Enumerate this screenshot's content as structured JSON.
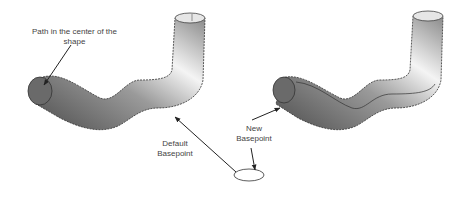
{
  "figure": {
    "left_shape": {
      "annotation": "Path in the center of the shape"
    },
    "right_shape": {},
    "labels": {
      "default_basepoint": "Default Basepoint",
      "new_basepoint": "New Basepoint",
      "path_center_line1": "Path in the center of the",
      "path_center_line2": "shape",
      "default_line1": "Default",
      "default_line2": "Basepoint",
      "new_line1": "New",
      "new_line2": "Basepoint"
    },
    "colors": {
      "tube_dark": "#5a5a5a",
      "tube_light": "#f2f2f2",
      "outline": "#333333",
      "arrow": "#222222"
    }
  }
}
